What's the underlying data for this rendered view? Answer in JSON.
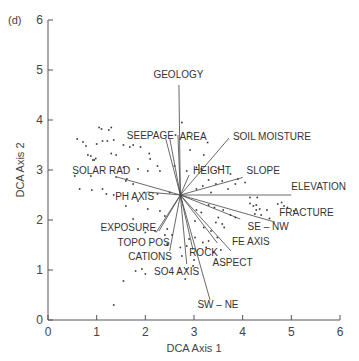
{
  "panel_label": "(d)",
  "chart_data": {
    "type": "scatter",
    "subtype": "ordination biplot (DCA) with environmental vectors",
    "title": "",
    "xlabel": "DCA Axis 1",
    "ylabel": "DCA Axis 2",
    "xlim": [
      0,
      6
    ],
    "ylim": [
      0,
      6
    ],
    "xticks": [
      0,
      1,
      2,
      3,
      4,
      5,
      6
    ],
    "yticks": [
      0,
      1,
      2,
      3,
      4,
      5,
      6
    ],
    "grid": false,
    "legend": null,
    "vector_origin": [
      2.72,
      2.5
    ],
    "vectors": [
      {
        "label": "GEOLOGY",
        "x": 2.69,
        "y": 4.7
      },
      {
        "label": "AREA",
        "x": 2.67,
        "y": 3.7
      },
      {
        "label": "SEEPAGE",
        "x": 2.42,
        "y": 3.62
      },
      {
        "label": "SEEPAGE",
        "x": 2.5,
        "y": 3.64
      },
      {
        "label": "SOIL MOISTURE",
        "x": 3.72,
        "y": 3.64
      },
      {
        "label": "HEIGHT",
        "x": 2.9,
        "y": 2.9
      },
      {
        "label": "SLOPE",
        "x": 4.0,
        "y": 2.85
      },
      {
        "label": "ELEVATION",
        "x": 5.0,
        "y": 2.5
      },
      {
        "label": "FRACTURE",
        "x": 4.66,
        "y": 1.96
      },
      {
        "label": "SE – NW",
        "x": 3.95,
        "y": 2.02
      },
      {
        "label": "FE AXIS",
        "x": 3.76,
        "y": 1.38
      },
      {
        "label": "ASPECT",
        "x": 3.48,
        "y": 1.54
      },
      {
        "label": "ROCK",
        "x": 2.98,
        "y": 1.4
      },
      {
        "label": "SW – NE",
        "x": 3.33,
        "y": 0.4
      },
      {
        "label": "SO4 AXIS",
        "x": 2.85,
        "y": 1.12
      },
      {
        "label": "CATIONS",
        "x": 2.5,
        "y": 1.38
      },
      {
        "label": "TOPO POS",
        "x": 2.22,
        "y": 1.75
      },
      {
        "label": "EXPOSURE",
        "x": 2.28,
        "y": 1.78
      },
      {
        "label": "PH AXIS",
        "x": 2.04,
        "y": 2.56
      },
      {
        "label": "SOLAR RAD",
        "x": 1.42,
        "y": 2.86
      }
    ],
    "labels": [
      {
        "text": "GEOLOGY",
        "x": 2.68,
        "y": 4.85,
        "anchor": "middle"
      },
      {
        "text": "SEEPAGE",
        "x": 1.62,
        "y": 3.62,
        "anchor": "start"
      },
      {
        "text": "AREA",
        "x": 2.7,
        "y": 3.6,
        "anchor": "start"
      },
      {
        "text": "SOIL MOISTURE",
        "x": 3.8,
        "y": 3.6,
        "anchor": "start"
      },
      {
        "text": "HEIGHT",
        "x": 2.98,
        "y": 2.93,
        "anchor": "start"
      },
      {
        "text": "SLOPE",
        "x": 4.08,
        "y": 2.92,
        "anchor": "start"
      },
      {
        "text": "SOLAR RAD",
        "x": 0.5,
        "y": 2.92,
        "anchor": "start"
      },
      {
        "text": "ELEVATION",
        "x": 5.0,
        "y": 2.6,
        "anchor": "start"
      },
      {
        "text": "PH AXIS",
        "x": 1.38,
        "y": 2.4,
        "anchor": "start"
      },
      {
        "text": "FRACTURE",
        "x": 4.75,
        "y": 2.08,
        "anchor": "start"
      },
      {
        "text": "SE – NW",
        "x": 4.1,
        "y": 1.8,
        "anchor": "start"
      },
      {
        "text": "EXPOSURE",
        "x": 1.08,
        "y": 1.78,
        "anchor": "start"
      },
      {
        "text": "TOPO POS",
        "x": 1.43,
        "y": 1.49,
        "anchor": "start"
      },
      {
        "text": "FE AXIS",
        "x": 3.78,
        "y": 1.5,
        "anchor": "start"
      },
      {
        "text": "ROCK",
        "x": 2.9,
        "y": 1.28,
        "anchor": "start"
      },
      {
        "text": "CATIONS",
        "x": 1.65,
        "y": 1.2,
        "anchor": "start"
      },
      {
        "text": "ASPECT",
        "x": 3.38,
        "y": 1.08,
        "anchor": "start"
      },
      {
        "text": "SO4 AXIS",
        "x": 2.18,
        "y": 0.9,
        "anchor": "start"
      },
      {
        "text": "SW – NE",
        "x": 3.07,
        "y": 0.25,
        "anchor": "start"
      }
    ],
    "points": [
      [
        0.95,
        3.2
      ],
      [
        0.6,
        3.62
      ],
      [
        0.72,
        3.56
      ],
      [
        0.78,
        3.48
      ],
      [
        0.82,
        3.3
      ],
      [
        0.88,
        3.28
      ],
      [
        0.92,
        3.2
      ],
      [
        0.98,
        3.23
      ],
      [
        1.05,
        3.85
      ],
      [
        1.1,
        3.82
      ],
      [
        1.25,
        3.8
      ],
      [
        1.3,
        3.85
      ],
      [
        1.22,
        3.58
      ],
      [
        1.12,
        3.58
      ],
      [
        1.0,
        3.52
      ],
      [
        1.35,
        3.6
      ],
      [
        1.3,
        3.33
      ],
      [
        1.4,
        3.3
      ],
      [
        1.55,
        3.5
      ],
      [
        1.68,
        3.46
      ],
      [
        1.75,
        3.5
      ],
      [
        1.9,
        3.46
      ],
      [
        2.08,
        3.33
      ],
      [
        2.1,
        3.22
      ],
      [
        1.55,
        3.05
      ],
      [
        1.85,
        3.02
      ],
      [
        2.05,
        2.98
      ],
      [
        2.25,
        3.08
      ],
      [
        1.75,
        2.72
      ],
      [
        1.62,
        2.82
      ],
      [
        2.3,
        2.98
      ],
      [
        0.55,
        2.88
      ],
      [
        0.88,
        2.88
      ],
      [
        1.4,
        2.86
      ],
      [
        1.12,
        2.62
      ],
      [
        0.65,
        2.62
      ],
      [
        0.9,
        2.6
      ],
      [
        1.2,
        2.52
      ],
      [
        1.6,
        2.78
      ],
      [
        1.98,
        2.55
      ],
      [
        2.25,
        2.52
      ],
      [
        2.5,
        2.55
      ],
      [
        1.85,
        2.38
      ],
      [
        2.05,
        2.22
      ],
      [
        2.3,
        2.18
      ],
      [
        2.4,
        2.08
      ],
      [
        1.35,
        2.5
      ],
      [
        1.6,
        2.28
      ],
      [
        1.75,
        2.02
      ],
      [
        2.0,
        1.75
      ],
      [
        2.2,
        1.78
      ],
      [
        2.4,
        1.7
      ],
      [
        2.55,
        1.7
      ],
      [
        2.45,
        1.52
      ],
      [
        1.8,
        0.98
      ],
      [
        1.93,
        1.02
      ],
      [
        2.0,
        0.92
      ],
      [
        1.55,
        0.78
      ],
      [
        1.35,
        0.3
      ],
      [
        2.45,
        1.82
      ],
      [
        2.6,
        3.08
      ],
      [
        2.62,
        3.7
      ],
      [
        2.75,
        3.95
      ],
      [
        2.9,
        3.75
      ],
      [
        2.92,
        3.4
      ],
      [
        3.1,
        3.1
      ],
      [
        3.28,
        3.55
      ],
      [
        3.15,
        3.02
      ],
      [
        3.05,
        3.05
      ],
      [
        2.85,
        2.98
      ],
      [
        3.5,
        3.03
      ],
      [
        3.6,
        3.08
      ],
      [
        3.75,
        2.92
      ],
      [
        3.9,
        2.82
      ],
      [
        3.85,
        2.72
      ],
      [
        4.05,
        2.75
      ],
      [
        3.3,
        2.8
      ],
      [
        3.45,
        2.72
      ],
      [
        3.58,
        2.78
      ],
      [
        3.05,
        2.62
      ],
      [
        3.18,
        2.68
      ],
      [
        3.35,
        2.55
      ],
      [
        3.7,
        2.62
      ],
      [
        3.2,
        3.3
      ],
      [
        4.15,
        2.33
      ],
      [
        4.22,
        2.28
      ],
      [
        4.28,
        2.2
      ],
      [
        4.35,
        2.22
      ],
      [
        4.38,
        2.1
      ],
      [
        4.25,
        2.12
      ],
      [
        4.5,
        2.2
      ],
      [
        4.55,
        2.03
      ],
      [
        4.72,
        2.32
      ],
      [
        4.8,
        2.35
      ],
      [
        4.85,
        2.28
      ],
      [
        4.92,
        2.25
      ],
      [
        5.05,
        2.18
      ],
      [
        4.28,
        2.3
      ],
      [
        4.15,
        2.45
      ],
      [
        4.3,
        2.45
      ],
      [
        3.3,
        2.3
      ],
      [
        3.42,
        2.25
      ],
      [
        3.6,
        2.2
      ],
      [
        3.75,
        2.1
      ],
      [
        3.85,
        2.05
      ],
      [
        3.5,
        2.05
      ],
      [
        3.15,
        2.15
      ],
      [
        3.05,
        2.2
      ],
      [
        3.02,
        1.98
      ],
      [
        3.2,
        1.85
      ],
      [
        3.35,
        1.78
      ],
      [
        3.45,
        1.95
      ],
      [
        3.58,
        1.92
      ],
      [
        3.62,
        1.85
      ],
      [
        3.48,
        1.65
      ],
      [
        3.3,
        1.58
      ],
      [
        3.18,
        1.55
      ],
      [
        3.25,
        1.45
      ],
      [
        3.4,
        1.35
      ],
      [
        3.02,
        1.65
      ],
      [
        2.9,
        1.62
      ],
      [
        2.85,
        1.48
      ],
      [
        2.75,
        1.28
      ],
      [
        2.72,
        1.45
      ],
      [
        2.98,
        1.08
      ],
      [
        2.85,
        1.02
      ],
      [
        2.7,
        0.95
      ],
      [
        3.0,
        1.2
      ],
      [
        3.55,
        1.4
      ],
      [
        2.82,
        0.82
      ]
    ]
  }
}
